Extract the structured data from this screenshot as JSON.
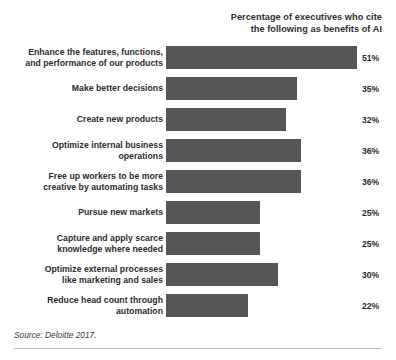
{
  "chart_data": {
    "type": "bar",
    "orientation": "horizontal",
    "title_lines": [
      "Percentage of executives who cite",
      "the following as benefits of AI"
    ],
    "xlabel": "",
    "ylabel": "",
    "xlim": [
      0,
      51
    ],
    "grid": false,
    "legend": "none",
    "bar_color": "#555558",
    "value_suffix": "%",
    "source": "Source: Deloitte 2017.",
    "categories": [
      "Enhance the features, functions, and performance of our products",
      "Make better decisions",
      "Create new products",
      "Optimize internal business operations",
      "Free up workers to be more creative by automating tasks",
      "Pursue new markets",
      "Capture and apply scarce knowledge where needed",
      "Optimize external processes like marketing and sales",
      "Reduce head count through automation"
    ],
    "values": [
      51,
      35,
      32,
      36,
      36,
      25,
      25,
      30,
      22
    ],
    "bars": [
      {
        "label_lines": [
          "Enhance the features, functions,",
          "and performance of our products"
        ],
        "value": 51,
        "value_label": "51%"
      },
      {
        "label_lines": [
          "Make better decisions"
        ],
        "value": 35,
        "value_label": "35%"
      },
      {
        "label_lines": [
          "Create new products"
        ],
        "value": 32,
        "value_label": "32%"
      },
      {
        "label_lines": [
          "Optimize internal business",
          "operations"
        ],
        "value": 36,
        "value_label": "36%"
      },
      {
        "label_lines": [
          "Free up workers to be more",
          "creative by automating tasks"
        ],
        "value": 36,
        "value_label": "36%"
      },
      {
        "label_lines": [
          "Pursue new markets"
        ],
        "value": 25,
        "value_label": "25%"
      },
      {
        "label_lines": [
          "Capture and apply scarce",
          "knowledge where needed"
        ],
        "value": 25,
        "value_label": "25%"
      },
      {
        "label_lines": [
          "Optimize external processes",
          "like marketing and sales"
        ],
        "value": 30,
        "value_label": "30%"
      },
      {
        "label_lines": [
          "Reduce head count through",
          "automation"
        ],
        "value": 22,
        "value_label": "22%"
      }
    ]
  }
}
